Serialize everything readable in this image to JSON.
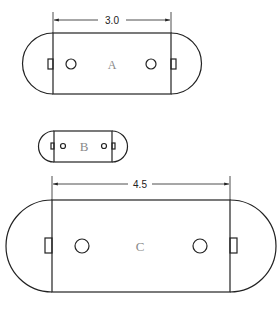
{
  "diagram": {
    "type": "rounded-rectangle-shapes",
    "stroke_color": "#222222",
    "label_color": "#8a8a8a",
    "shapes": [
      {
        "label": "A",
        "dimension_label": "3.0",
        "rect": {
          "x1": 53,
          "y1": 33,
          "x2": 171,
          "y2": 94
        },
        "holes": [
          {
            "cx": 71,
            "cy": 64,
            "r": 5
          },
          {
            "cx": 151,
            "cy": 64,
            "r": 5
          }
        ],
        "dimension_y": 20
      },
      {
        "label": "B",
        "rect": {
          "x1": 54,
          "y1": 131,
          "x2": 112,
          "y2": 162
        },
        "holes": [
          {
            "cx": 63,
            "cy": 146,
            "r": 2.5
          },
          {
            "cx": 104,
            "cy": 146,
            "r": 2.5
          }
        ]
      },
      {
        "label": "C",
        "dimension_label": "4.5",
        "rect": {
          "x1": 52,
          "y1": 200,
          "x2": 230,
          "y2": 292
        },
        "holes": [
          {
            "cx": 82,
            "cy": 246,
            "r": 7
          },
          {
            "cx": 200,
            "cy": 246,
            "r": 7
          }
        ],
        "dimension_y": 184
      }
    ]
  }
}
